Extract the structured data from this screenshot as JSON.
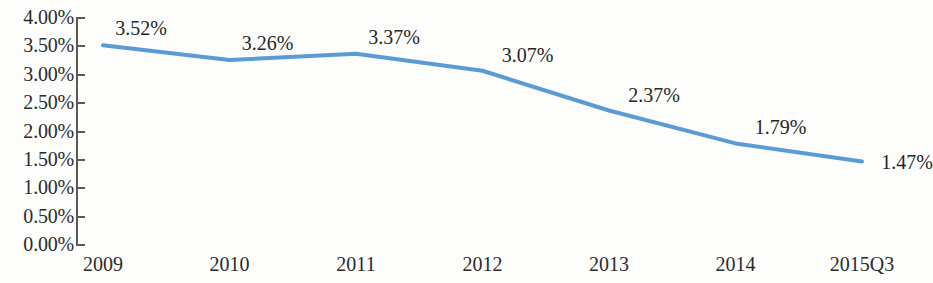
{
  "chart_data": {
    "type": "line",
    "title": "",
    "subtitle": "",
    "xlabel": "",
    "ylabel": "",
    "categories": [
      "2009",
      "2010",
      "2011",
      "2012",
      "2013",
      "2014",
      "2015Q3"
    ],
    "values": [
      3.52,
      3.26,
      3.37,
      3.07,
      2.37,
      1.79,
      1.47
    ],
    "value_labels": [
      "3.52%",
      "3.26%",
      "3.37%",
      "3.07%",
      "2.37%",
      "1.79%",
      "1.47%"
    ],
    "series": [
      {
        "name": "",
        "values": [
          3.52,
          3.26,
          3.37,
          3.07,
          2.37,
          1.79,
          1.47
        ],
        "color": "#5b9bd5"
      }
    ],
    "ylim": [
      0,
      4
    ],
    "ytick_values": [
      4.0,
      3.5,
      3.0,
      2.5,
      2.0,
      1.5,
      1.0,
      0.5,
      0.0
    ],
    "ytick_labels": [
      "4.00%",
      "3.50%",
      "3.00%",
      "2.50%",
      "2.00%",
      "1.50%",
      "1.00%",
      "0.50%",
      "0.00%"
    ],
    "grid": false,
    "legend": "none",
    "line_color": "#5b9bd5",
    "axis_color": "#5a5a52",
    "text_color": "#262626",
    "background_color": "#fdfdfb",
    "markers": false,
    "data_labels_shown": true
  },
  "axis": {
    "y_labels": [
      "4.00%",
      "3.50%",
      "3.00%",
      "2.50%",
      "2.00%",
      "1.50%",
      "1.00%",
      "0.50%",
      "0.00%"
    ],
    "x_labels": [
      "2009",
      "2010",
      "2011",
      "2012",
      "2013",
      "2014",
      "2015Q3"
    ]
  },
  "labels": {
    "points": [
      "3.52%",
      "3.26%",
      "3.37%",
      "3.07%",
      "2.37%",
      "1.79%",
      "1.47%"
    ]
  }
}
